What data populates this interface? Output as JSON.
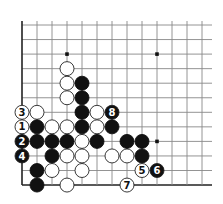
{
  "diagram": {
    "grid": {
      "origin_x": 22,
      "origin_y": 25,
      "col_spacing": 15,
      "row_spacing": 14.55,
      "cols": 14,
      "rows": 12,
      "right_extent": 212,
      "edges": [
        "left",
        "bottom"
      ],
      "line_color": "#888888",
      "edge_color": "#222222"
    },
    "star_points": [
      [
        3,
        2
      ],
      [
        9,
        2
      ],
      [
        9,
        8
      ]
    ],
    "stone_radius": 7,
    "colors": {
      "black": "#111111",
      "white": "#ffffff",
      "stroke": "#222222"
    },
    "white_stones": [
      [
        3,
        3
      ],
      [
        3,
        4
      ],
      [
        3,
        5
      ],
      [
        1,
        6
      ],
      [
        5,
        6
      ],
      [
        2,
        7
      ],
      [
        3,
        7
      ],
      [
        5,
        7
      ],
      [
        4,
        8
      ],
      [
        3,
        9
      ],
      [
        4,
        9
      ],
      [
        6,
        9
      ],
      [
        7,
        9
      ],
      [
        2,
        10
      ],
      [
        4,
        10
      ],
      [
        3,
        11
      ]
    ],
    "black_stones": [
      [
        4,
        4
      ],
      [
        4,
        5
      ],
      [
        4,
        6
      ],
      [
        1,
        7
      ],
      [
        4,
        7
      ],
      [
        6,
        7
      ],
      [
        1,
        8
      ],
      [
        2,
        8
      ],
      [
        3,
        8
      ],
      [
        5,
        8
      ],
      [
        7,
        8
      ],
      [
        8,
        8
      ],
      [
        2,
        9
      ],
      [
        8,
        9
      ],
      [
        1,
        10
      ],
      [
        1,
        11
      ]
    ],
    "numbered_moves": [
      {
        "n": "1",
        "color": "white",
        "col": 0,
        "row": 7
      },
      {
        "n": "2",
        "color": "black",
        "col": 0,
        "row": 8
      },
      {
        "n": "3",
        "color": "white",
        "col": 0,
        "row": 6
      },
      {
        "n": "4",
        "color": "black",
        "col": 0,
        "row": 9
      },
      {
        "n": "5",
        "color": "white",
        "col": 8,
        "row": 10
      },
      {
        "n": "6",
        "color": "black",
        "col": 9,
        "row": 10
      },
      {
        "n": "7",
        "color": "white",
        "col": 7,
        "row": 11
      },
      {
        "n": "8",
        "color": "black",
        "col": 6,
        "row": 6
      }
    ]
  }
}
